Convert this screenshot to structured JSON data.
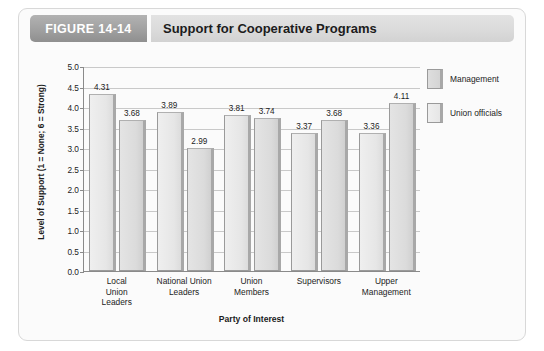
{
  "figure": {
    "number_label": "FIGURE 14-14",
    "title": "Support for Cooperative Programs"
  },
  "chart_data": {
    "type": "bar",
    "title": "Support for Cooperative Programs",
    "xlabel": "Party of Interest",
    "ylabel": "Level of Support (1 = None; 6 = Strong)",
    "ylim": [
      0.0,
      5.0
    ],
    "ytick_labels": [
      "5.0",
      "4.5",
      "4.0",
      "3.5",
      "3.0",
      "2.5",
      "2.0",
      "1.5",
      "1.0",
      "0.5",
      "0.0"
    ],
    "ytick_values": [
      5.0,
      4.5,
      4.0,
      3.5,
      3.0,
      2.5,
      2.0,
      1.5,
      1.0,
      0.5,
      0.0
    ],
    "grid": true,
    "legend_position": "right",
    "categories": [
      "Local Union Leaders",
      "National Union Leaders",
      "Union Members",
      "Supervisors",
      "Upper Management"
    ],
    "category_lines": [
      [
        "Local",
        "Union",
        "Leaders"
      ],
      [
        "National Union",
        "Leaders"
      ],
      [
        "Union",
        "Members"
      ],
      [
        "Supervisors"
      ],
      [
        "Upper",
        "Management"
      ]
    ],
    "series": [
      {
        "name": "Management",
        "color": "#e6e6e6",
        "values": [
          4.31,
          3.89,
          3.81,
          3.37,
          3.36
        ],
        "labels": [
          "4.31",
          "3.89",
          "3.81",
          "3.37",
          "3.36"
        ]
      },
      {
        "name": "Union officials",
        "color": "#dbdbdb",
        "values": [
          3.68,
          2.99,
          3.74,
          3.68,
          4.11
        ],
        "labels": [
          "3.68",
          "2.99",
          "3.74",
          "3.68",
          "4.11"
        ]
      }
    ]
  }
}
